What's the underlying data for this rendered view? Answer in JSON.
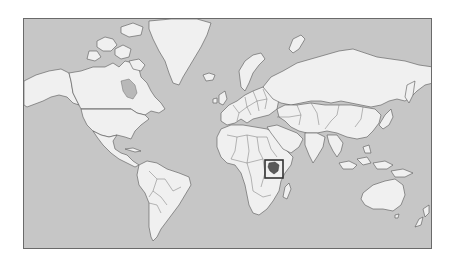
{
  "map": {
    "type": "world-locator-map",
    "projection": "mercator",
    "highlighted_country": "Kenya",
    "colors": {
      "ocean": "#c6c6c6",
      "land": "#f0f0f0",
      "borders": "#555555",
      "highlight": "#5a5a5a",
      "highlight_box": "#333333",
      "background": "#ffffff"
    },
    "highlight_box": {
      "x": 264,
      "y": 159,
      "width": 18,
      "height": 18
    }
  }
}
